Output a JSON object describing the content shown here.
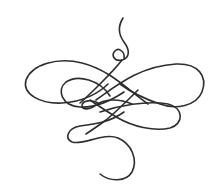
{
  "illustration": {
    "subject": "calligraphic flourish ornament",
    "background": "#ffffff",
    "stroke_color": "#2e2e2e",
    "stroke_width": 1.6
  }
}
